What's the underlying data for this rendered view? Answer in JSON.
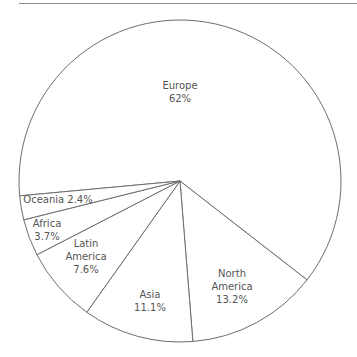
{
  "chart_data": {
    "type": "pie",
    "title": "",
    "center": [
      180,
      181
    ],
    "radius": 161,
    "start_angle_deg": 174.7,
    "direction": "clockwise",
    "slices": [
      {
        "label": "Europe",
        "value": 62,
        "display": "62%"
      },
      {
        "label": "North America",
        "value": 13.2,
        "display": "13.2%"
      },
      {
        "label": "Asia",
        "value": 11.1,
        "display": "11.1%"
      },
      {
        "label": "Latin America",
        "value": 7.6,
        "display": "7.6%"
      },
      {
        "label": "Africa",
        "value": 3.7,
        "display": "3.7%"
      },
      {
        "label": "Oceania",
        "value": 2.4,
        "display": "2.4%"
      }
    ],
    "colors": {
      "fill": "#ffffff",
      "stroke": "#6e6e6e",
      "text": "#555555"
    }
  },
  "labels": {
    "europe": {
      "line1": "Europe",
      "line2": "62%"
    },
    "north_america": {
      "line1": "North",
      "line2": "America",
      "line3": "13.2%"
    },
    "asia": {
      "line1": "Asia",
      "line2": "11.1%"
    },
    "latin_america": {
      "line1": "Latin",
      "line2": "America",
      "line3": "7.6%"
    },
    "africa": {
      "line1": "Africa",
      "line2": "3.7%"
    },
    "oceania": {
      "line1": "Oceania 2.4%"
    }
  }
}
